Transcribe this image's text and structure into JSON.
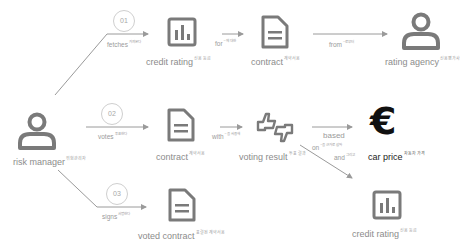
{
  "colors": {
    "icon": "#7a7a7a",
    "line": "#9a9a9a",
    "badge_border": "#cfcfcf",
    "text": "#8c8c8c",
    "euro": "#111111"
  },
  "actor": {
    "label": "risk manager",
    "sup": "위험관리자",
    "icon": "person-icon"
  },
  "steps": [
    {
      "number": "01",
      "verb": "fetches",
      "verb_sup": "가져온다"
    },
    {
      "number": "02",
      "verb": "votes",
      "verb_sup": "투표한다"
    },
    {
      "number": "03",
      "verb": "signs",
      "verb_sup": "서명한다"
    }
  ],
  "nodes": {
    "credit_rating_top": {
      "label": "credit rating",
      "sup": "신용 등급",
      "icon": "bar-chart-icon"
    },
    "contract_top": {
      "label": "contract",
      "sup": "계약서용",
      "icon": "document-icon"
    },
    "rating_agency": {
      "label": "rating agency",
      "sup": "신용평가사",
      "icon": "person-icon"
    },
    "contract_mid": {
      "label": "contract",
      "sup": "계약서용",
      "icon": "document-icon"
    },
    "voting_result": {
      "label": "voting result",
      "sup": "투표 결과",
      "icon": "thumbs-up-down-icon"
    },
    "car_price": {
      "label": "car price",
      "sup": "자동차 가격",
      "icon": "euro-icon"
    },
    "credit_rating_bottom": {
      "label": "credit rating",
      "sup": "신용 등급",
      "icon": "bar-chart-icon"
    },
    "voted_contract": {
      "label": "voted contract",
      "sup": "표결된 계약서용",
      "icon": "document-icon"
    }
  },
  "edges": {
    "for": {
      "label": "for",
      "sup": "~에 대한"
    },
    "from": {
      "label": "from",
      "sup": "~로부터"
    },
    "with": {
      "label": "with",
      "sup": "~을 사용해"
    },
    "based_on": {
      "label": "based",
      "label2": "on",
      "sup": "~을 근거로 삼아"
    },
    "and": {
      "label": "and",
      "sup": "그리고"
    }
  }
}
